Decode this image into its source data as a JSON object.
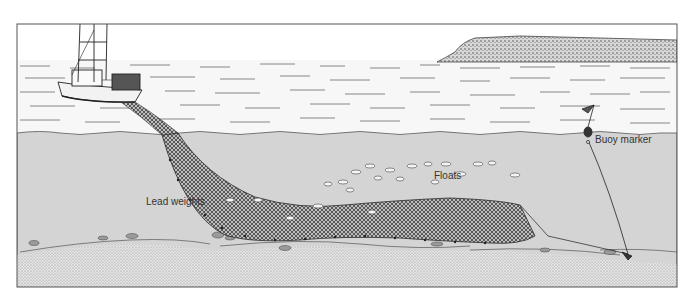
{
  "figure": {
    "labels": {
      "lead_weights": "Lead weights",
      "floats": "Floats",
      "buoy_marker": "Buoy marker"
    },
    "elements": [
      "fishing-boat",
      "island",
      "sea-surface",
      "gillnet",
      "fish-school",
      "buoy-marker",
      "seabed",
      "anchor"
    ]
  },
  "colors": {
    "sky": "#ffffff",
    "water_surface": "#f6f6f6",
    "underwater": "#d4d4d4",
    "seabed": "#e6e6e6",
    "net": "#3a3a3a",
    "frame": "#555555"
  }
}
